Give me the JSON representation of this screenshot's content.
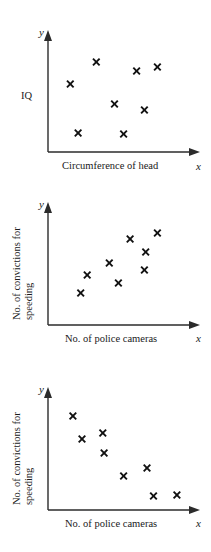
{
  "page": {
    "width": 211,
    "height": 552,
    "background": "#ffffff",
    "ink_color": "#1a1a1a",
    "marker_color": "#111111"
  },
  "charts": [
    {
      "id": "chart-1",
      "label": "IQ against circumference of head",
      "x_axis_letter": "x",
      "y_axis_letter": "y",
      "xlabel": "Circumference of head",
      "ylabel": "IQ",
      "ylabel_lines": [
        "IQ"
      ],
      "correlation": "no correlation"
    },
    {
      "id": "chart-2",
      "label": "Convictions against police cameras (positive)",
      "x_axis_letter": "x",
      "y_axis_letter": "y",
      "xlabel": "No. of police cameras",
      "ylabel": "No. of convictions for speeding",
      "ylabel_lines": [
        "No. of convictions for",
        "speeding"
      ],
      "correlation": "positive correlation"
    },
    {
      "id": "chart-3",
      "label": "Convictions against police cameras (negative)",
      "x_axis_letter": "x",
      "y_axis_letter": "y",
      "xlabel": "No. of police cameras",
      "ylabel": "No. of convictions for speeding",
      "ylabel_lines": [
        "No. of convictions for",
        "speeding"
      ],
      "correlation": "negative correlation"
    }
  ],
  "chart_data": [
    {
      "type": "scatter",
      "title": "",
      "xlabel": "Circumference of head",
      "ylabel": "IQ",
      "xlim": [
        0,
        100
      ],
      "ylim": [
        0,
        100
      ],
      "grid": false,
      "legend": "none",
      "marker": "x",
      "annotation": "no correlation",
      "points": [
        {
          "x": 31,
          "y": 80
        },
        {
          "x": 11,
          "y": 58
        },
        {
          "x": 62,
          "y": 71
        },
        {
          "x": 78,
          "y": 75
        },
        {
          "x": 45,
          "y": 38
        },
        {
          "x": 68,
          "y": 32
        },
        {
          "x": 17,
          "y": 9
        },
        {
          "x": 52,
          "y": 8
        }
      ]
    },
    {
      "type": "scatter",
      "title": "",
      "xlabel": "No. of police cameras",
      "ylabel": "No. of convictions for speeding",
      "xlim": [
        0,
        100
      ],
      "ylim": [
        0,
        100
      ],
      "grid": false,
      "legend": "none",
      "marker": "x",
      "annotation": "positive correlation",
      "points": [
        {
          "x": 19,
          "y": 22
        },
        {
          "x": 24,
          "y": 40
        },
        {
          "x": 41,
          "y": 52
        },
        {
          "x": 48,
          "y": 32
        },
        {
          "x": 57,
          "y": 76
        },
        {
          "x": 68,
          "y": 45
        },
        {
          "x": 69,
          "y": 63
        },
        {
          "x": 78,
          "y": 82
        }
      ]
    },
    {
      "type": "scatter",
      "title": "",
      "xlabel": "No. of police cameras",
      "ylabel": "No. of convictions for speeding",
      "xlim": [
        0,
        100
      ],
      "ylim": [
        0,
        100
      ],
      "grid": false,
      "legend": "none",
      "marker": "x",
      "annotation": "negative correlation",
      "points": [
        {
          "x": 13,
          "y": 84
        },
        {
          "x": 20,
          "y": 61
        },
        {
          "x": 36,
          "y": 67
        },
        {
          "x": 37,
          "y": 47
        },
        {
          "x": 52,
          "y": 24
        },
        {
          "x": 70,
          "y": 32
        },
        {
          "x": 75,
          "y": 4
        },
        {
          "x": 93,
          "y": 5
        }
      ]
    }
  ]
}
